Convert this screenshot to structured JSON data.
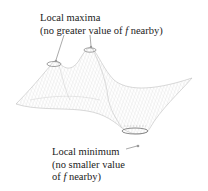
{
  "figure": {
    "type": "3d-surface",
    "colors": {
      "surface_stroke": "#b8b8b8",
      "ring_stroke": "#8a8a8a",
      "leader_stroke": "#707070",
      "text": "#222222"
    }
  },
  "annotations": {
    "maxima": {
      "line1": "Local maxima",
      "line2_prefix": "(no greater value of ",
      "line2_var": "f",
      "line2_suffix": " nearby)"
    },
    "minimum": {
      "line1": "Local minimum",
      "line2": "(no smaller value",
      "line3_prefix": "of ",
      "line3_var": "f",
      "line3_suffix": " nearby)"
    }
  }
}
